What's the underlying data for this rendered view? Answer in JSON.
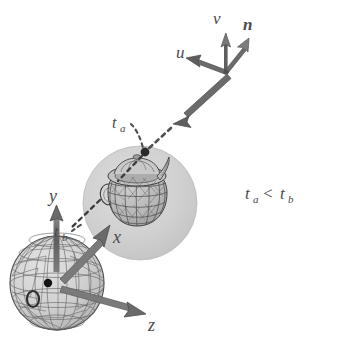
{
  "figure": {
    "background_color": "#ffffff",
    "width": 345,
    "height": 348
  },
  "colors": {
    "background": "#ffffff",
    "arrow_dark": "#565656",
    "arrow_mid": "#6e6e6e",
    "arrow_light": "#8d8d8d",
    "bounding_sphere_fill": "#cdcdcd",
    "wire_sphere_fill": "#d5d5d5",
    "wire_line": "#6a6a6a",
    "teapot_line": "#4f4f4f",
    "teapot_fill": "#b9b9b9",
    "label_text": "#4a4a4a",
    "dot_black": "#111111",
    "dash_gray": "#555555"
  },
  "camera_frame": {
    "name": "camera-basis",
    "origin": {
      "x": 226,
      "y": 72
    },
    "vectors": [
      {
        "id": "u",
        "label": "u",
        "label_x": 176,
        "label_y": 58,
        "tip_x": 188,
        "tip_y": 58
      },
      {
        "id": "v",
        "label": "v",
        "label_x": 219,
        "label_y": 22,
        "tip_x": 224,
        "tip_y": 37
      },
      {
        "id": "n",
        "label": "n",
        "label_x": 248,
        "label_y": 28,
        "tip_x": 245,
        "tip_y": 41
      }
    ]
  },
  "world_frame": {
    "name": "world-axes",
    "origin": {
      "x": 57,
      "y": 283
    },
    "axes": [
      {
        "id": "y",
        "label": "y",
        "label_x": 55,
        "label_y": 196,
        "tip_x": 57,
        "tip_y": 209
      },
      {
        "id": "x",
        "label": "x",
        "label_x": 117,
        "label_y": 240,
        "tip_x": 105,
        "tip_y": 227
      },
      {
        "id": "z",
        "label": "z",
        "label_x": 152,
        "label_y": 327,
        "tip_x": 140,
        "tip_y": 315
      }
    ],
    "origin_marker": {
      "label": "o",
      "label_x": 38,
      "label_y": 302,
      "dot_x": 48,
      "dot_y": 283
    }
  },
  "ray": {
    "name": "view-ray",
    "solid_start": {
      "x": 226,
      "y": 72
    },
    "solid_end": {
      "x": 178,
      "y": 120
    },
    "dashed_to_hit_a": {
      "x": 146,
      "y": 152
    },
    "dashed_to_hit_b": {
      "x": 70,
      "y": 228
    }
  },
  "intersections": [
    {
      "id": "t_a",
      "label": "t",
      "subscript": "a",
      "label_x": 110,
      "label_y": 124,
      "point_x": 146,
      "point_y": 152,
      "description": "near intersection on bounding sphere"
    },
    {
      "id": "t_b",
      "label": "t",
      "subscript": "b",
      "label_x": 58,
      "label_y": 234,
      "point_x": 70,
      "point_y": 228,
      "description": "far intersection on wireframe sphere"
    }
  ],
  "bounding_sphere": {
    "name": "bounding-sphere",
    "cx": 140,
    "cy": 203,
    "r": 57,
    "fill": "#cdcdcd"
  },
  "wire_sphere": {
    "name": "wireframe-sphere",
    "cx": 57,
    "cy": 283,
    "r": 47,
    "fill": "#d5d5d5"
  },
  "teapot": {
    "name": "teapot-wireframe",
    "cx": 137,
    "cy": 198,
    "body_rx": 30,
    "body_ry": 26
  },
  "annotation": {
    "inequality_lhs": "t",
    "inequality_lhs_sub": "a",
    "inequality_op": "<",
    "inequality_rhs": "t",
    "inequality_rhs_sub": "b",
    "x": 245,
    "y": 196
  }
}
